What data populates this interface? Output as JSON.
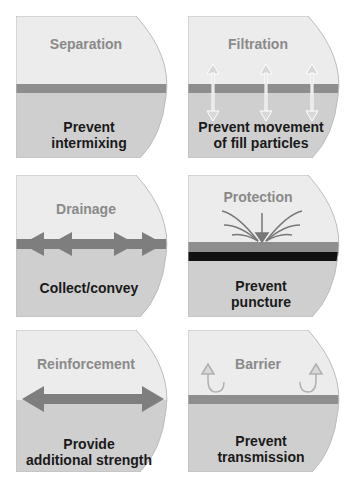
{
  "colors": {
    "upper_fill": "#ececec",
    "lower_fill": "#cfcfcf",
    "layer": "#8e8e8e",
    "outline": "#bdbdbd",
    "title_text": "#8a8a8a",
    "caption_text": "#1a1a1a",
    "black_layer": "#111111"
  },
  "panels": [
    {
      "title": "Separation",
      "caption_line1": "Prevent",
      "caption_line2": "intermixing",
      "icon": "layer-line"
    },
    {
      "title": "Filtration",
      "caption_line1": "Prevent movement",
      "caption_line2": "of fill particles",
      "icon": "double-arrows-vertical"
    },
    {
      "title": "Drainage",
      "caption_line1": "Collect/convey",
      "caption_line2": "",
      "icon": "double-arrows-horizontal"
    },
    {
      "title": "Protection",
      "caption_line1": "Prevent",
      "caption_line2": "puncture",
      "icon": "impact-arrow"
    },
    {
      "title": "Reinforcement",
      "caption_line1": "Provide",
      "caption_line2": "additional strength",
      "icon": "tension-arrow"
    },
    {
      "title": "Barrier",
      "caption_line1": "Prevent",
      "caption_line2": "transmission",
      "icon": "u-turn-arrows"
    }
  ]
}
